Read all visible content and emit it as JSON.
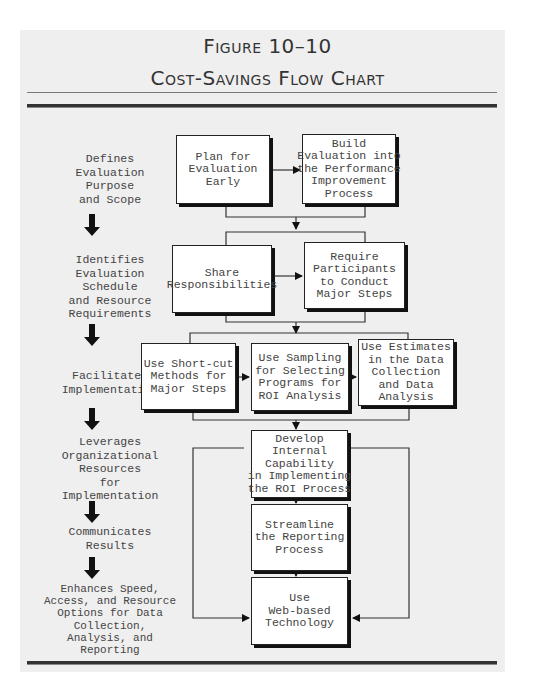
{
  "figure": {
    "number": "Figure 10–10",
    "title": "Cost-Savings Flow Chart"
  },
  "stages": [
    {
      "label": "Defines\nEvaluation\nPurpose\nand Scope"
    },
    {
      "label": "Identifies\nEvaluation\nSchedule\nand Resource\nRequirements"
    },
    {
      "label": "Facilitates\nImplementation"
    },
    {
      "label": "Leverages\nOrganizational\nResources\nfor\nImplementation"
    },
    {
      "label": "Communicates\nResults"
    },
    {
      "label": "Enhances Speed,\nAccess, and Resource\nOptions for Data\nCollection,\nAnalysis, and\nReporting"
    }
  ],
  "boxes": {
    "plan_early": "Plan for\nEvaluation\nEarly",
    "build_into": "Build\nEvaluation into\nthe Performance\nImprovement\nProcess",
    "share_resp": "Share\nResponsibilities",
    "require_participants": "Require\nParticipants\nto Conduct\nMajor Steps",
    "short_cut": "Use Short-cut\nMethods for\nMajor Steps",
    "sampling": "Use Sampling\nfor Selecting\nPrograms for\nROI Analysis",
    "estimates": "Use Estimates\nin the Data\nCollection\nand Data\nAnalysis",
    "develop_internal": "Develop\nInternal\nCapability\nin Implementing\nthe ROI Process",
    "streamline": "Streamline\nthe Reporting\nProcess",
    "web_based": "Use\nWeb-based\nTechnology"
  },
  "colors": {
    "panel_bg": "#efefef",
    "line": "#222222",
    "text": "#444444"
  }
}
